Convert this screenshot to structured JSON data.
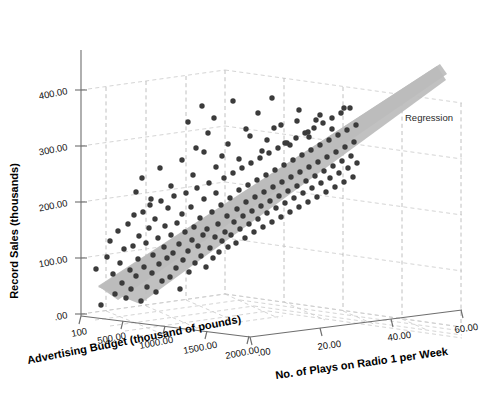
{
  "chart_data": {
    "type": "scatter",
    "projection": "3d",
    "title": "",
    "xlabel": "Advertising Budget (thousand of pounds)",
    "ylabel": "Record Sales (thousands)",
    "zlabel": "No. of Plays on Radio 1 per Week",
    "xticks": [
      "100",
      "500.00",
      "1000.00",
      "1500.00",
      "2000.00"
    ],
    "yticks": [
      "400.00",
      "300.00",
      "200.00",
      "100.00",
      ".00"
    ],
    "zticks": [
      ".00",
      "20.00",
      "40.00",
      "60.00"
    ],
    "xlim": [
      0,
      2400
    ],
    "ylim": [
      0,
      500
    ],
    "zlim": [
      0,
      70
    ],
    "grid": true,
    "legend_position": "inside-right",
    "annotations": [
      {
        "text": "Regression",
        "x": 405,
        "y": 118
      }
    ],
    "surface": {
      "name": "Regression",
      "kind": "plane",
      "color": "#bcbcbc"
    },
    "marker": {
      "shape": "circle",
      "color": "#3b3b3b",
      "size_px": 5.4
    },
    "n_points": 200,
    "points_px": [
      [
        96,
        269
      ],
      [
        101,
        305
      ],
      [
        107,
        257
      ],
      [
        110,
        241
      ],
      [
        113,
        274
      ],
      [
        115,
        294
      ],
      [
        118,
        231
      ],
      [
        120,
        263
      ],
      [
        122,
        283
      ],
      [
        124,
        249
      ],
      [
        126,
        298
      ],
      [
        128,
        224
      ],
      [
        130,
        270
      ],
      [
        131,
        289
      ],
      [
        133,
        246
      ],
      [
        134,
        215
      ],
      [
        136,
        276
      ],
      [
        138,
        259
      ],
      [
        139,
        236
      ],
      [
        141,
        301
      ],
      [
        143,
        212
      ],
      [
        144,
        267
      ],
      [
        146,
        243
      ],
      [
        147,
        287
      ],
      [
        149,
        228
      ],
      [
        150,
        205
      ],
      [
        152,
        273
      ],
      [
        153,
        255
      ],
      [
        155,
        219
      ],
      [
        156,
        292
      ],
      [
        158,
        238
      ],
      [
        159,
        264
      ],
      [
        161,
        201
      ],
      [
        162,
        281
      ],
      [
        164,
        247
      ],
      [
        165,
        226
      ],
      [
        167,
        258
      ],
      [
        168,
        208
      ],
      [
        170,
        277
      ],
      [
        171,
        235
      ],
      [
        173,
        253
      ],
      [
        174,
        196
      ],
      [
        176,
        268
      ],
      [
        177,
        223
      ],
      [
        179,
        244
      ],
      [
        180,
        289
      ],
      [
        182,
        214
      ],
      [
        183,
        260
      ],
      [
        185,
        232
      ],
      [
        186,
        193
      ],
      [
        188,
        251
      ],
      [
        189,
        272
      ],
      [
        191,
        207
      ],
      [
        192,
        240
      ],
      [
        194,
        227
      ],
      [
        195,
        263
      ],
      [
        197,
        188
      ],
      [
        198,
        246
      ],
      [
        200,
        218
      ],
      [
        201,
        256
      ],
      [
        203,
        235
      ],
      [
        204,
        199
      ],
      [
        206,
        267
      ],
      [
        207,
        229
      ],
      [
        209,
        183
      ],
      [
        210,
        248
      ],
      [
        212,
        212
      ],
      [
        213,
        258
      ],
      [
        215,
        237
      ],
      [
        216,
        193
      ],
      [
        218,
        224
      ],
      [
        219,
        252
      ],
      [
        221,
        205
      ],
      [
        222,
        241
      ],
      [
        224,
        178
      ],
      [
        225,
        232
      ],
      [
        227,
        216
      ],
      [
        228,
        247
      ],
      [
        230,
        198
      ],
      [
        231,
        235
      ],
      [
        233,
        173
      ],
      [
        234,
        222
      ],
      [
        236,
        243
      ],
      [
        237,
        209
      ],
      [
        239,
        190
      ],
      [
        240,
        229
      ],
      [
        242,
        168
      ],
      [
        243,
        216
      ],
      [
        245,
        238
      ],
      [
        246,
        202
      ],
      [
        248,
        185
      ],
      [
        249,
        224
      ],
      [
        251,
        163
      ],
      [
        252,
        211
      ],
      [
        254,
        232
      ],
      [
        255,
        197
      ],
      [
        257,
        180
      ],
      [
        258,
        219
      ],
      [
        260,
        158
      ],
      [
        261,
        206
      ],
      [
        263,
        227
      ],
      [
        264,
        192
      ],
      [
        266,
        175
      ],
      [
        267,
        213
      ],
      [
        269,
        153
      ],
      [
        270,
        201
      ],
      [
        272,
        222
      ],
      [
        273,
        187
      ],
      [
        275,
        170
      ],
      [
        276,
        208
      ],
      [
        278,
        148
      ],
      [
        279,
        196
      ],
      [
        281,
        217
      ],
      [
        282,
        182
      ],
      [
        284,
        165
      ],
      [
        285,
        203
      ],
      [
        287,
        143
      ],
      [
        288,
        191
      ],
      [
        290,
        212
      ],
      [
        291,
        177
      ],
      [
        293,
        160
      ],
      [
        294,
        198
      ],
      [
        296,
        138
      ],
      [
        297,
        186
      ],
      [
        299,
        207
      ],
      [
        300,
        172
      ],
      [
        302,
        155
      ],
      [
        303,
        193
      ],
      [
        305,
        133
      ],
      [
        306,
        181
      ],
      [
        308,
        202
      ],
      [
        309,
        167
      ],
      [
        311,
        150
      ],
      [
        312,
        188
      ],
      [
        314,
        128
      ],
      [
        315,
        176
      ],
      [
        317,
        197
      ],
      [
        318,
        162
      ],
      [
        320,
        145
      ],
      [
        321,
        183
      ],
      [
        323,
        123
      ],
      [
        324,
        171
      ],
      [
        326,
        192
      ],
      [
        327,
        157
      ],
      [
        329,
        140
      ],
      [
        330,
        178
      ],
      [
        332,
        118
      ],
      [
        333,
        166
      ],
      [
        335,
        187
      ],
      [
        336,
        152
      ],
      [
        338,
        135
      ],
      [
        339,
        173
      ],
      [
        341,
        113
      ],
      [
        342,
        161
      ],
      [
        344,
        182
      ],
      [
        345,
        147
      ],
      [
        347,
        130
      ],
      [
        348,
        168
      ],
      [
        350,
        108
      ],
      [
        351,
        156
      ],
      [
        353,
        177
      ],
      [
        354,
        142
      ],
      [
        356,
        125
      ],
      [
        357,
        163
      ],
      [
        188,
        122
      ],
      [
        202,
        106
      ],
      [
        208,
        133
      ],
      [
        196,
        148
      ],
      [
        214,
        118
      ],
      [
        222,
        156
      ],
      [
        233,
        101
      ],
      [
        246,
        129
      ],
      [
        258,
        113
      ],
      [
        267,
        140
      ],
      [
        272,
        98
      ],
      [
        281,
        125
      ],
      [
        290,
        145
      ],
      [
        299,
        110
      ],
      [
        308,
        132
      ],
      [
        316,
        120
      ],
      [
        136,
        192
      ],
      [
        142,
        178
      ],
      [
        151,
        199
      ],
      [
        160,
        168
      ],
      [
        171,
        186
      ],
      [
        182,
        160
      ],
      [
        193,
        175
      ],
      [
        204,
        152
      ],
      [
        216,
        167
      ],
      [
        228,
        144
      ],
      [
        239,
        159
      ],
      [
        250,
        136
      ],
      [
        262,
        151
      ],
      [
        274,
        128
      ],
      [
        285,
        143
      ],
      [
        297,
        121
      ],
      [
        309,
        137
      ],
      [
        320,
        115
      ],
      [
        332,
        129
      ],
      [
        344,
        108
      ]
    ]
  }
}
